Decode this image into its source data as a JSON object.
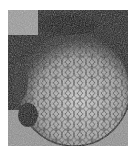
{
  "image": {
    "description": "Grainy black-and-white photograph of a sphere covered in a geodesic / flower-of-life line pattern against a dark, speckled background",
    "colors": {
      "dark": "#111111",
      "mid": "#7a7a7a",
      "light": "#d8d8d8",
      "background": "#ffffff"
    }
  }
}
